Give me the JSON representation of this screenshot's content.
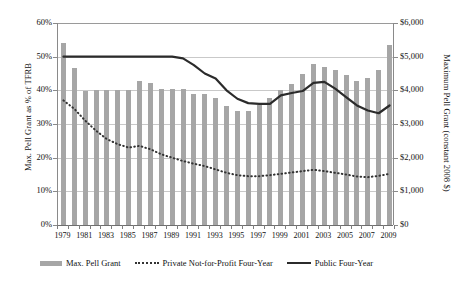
{
  "chart_data": {
    "type": "bar",
    "title": "",
    "subtitle": "",
    "xlabel": "",
    "ylabel": "Max. Pell Grant as % of TFRB",
    "y2label": "Maximum Pell Grant (constant 2008 $)",
    "grid": true,
    "legend_position": "bottom",
    "ylim": [
      0,
      60
    ],
    "y2lim": [
      0,
      6000
    ],
    "yticks": [
      "0%",
      "10%",
      "20%",
      "30%",
      "40%",
      "50%",
      "60%"
    ],
    "ytick_values": [
      0,
      10,
      20,
      30,
      40,
      50,
      60
    ],
    "y2ticks": [
      "$0",
      "$1,000",
      "$2,000",
      "$3,000",
      "$4,000",
      "$5,000",
      "$6,000"
    ],
    "y2tick_values": [
      0,
      1000,
      2000,
      3000,
      4000,
      5000,
      6000
    ],
    "x": [
      1979,
      1980,
      1981,
      1982,
      1983,
      1984,
      1985,
      1986,
      1987,
      1988,
      1989,
      1990,
      1991,
      1992,
      1993,
      1994,
      1995,
      1996,
      1997,
      1998,
      1999,
      2000,
      2001,
      2002,
      2003,
      2004,
      2005,
      2006,
      2007,
      2008,
      2009
    ],
    "xtick_labels": [
      "1979",
      "1981",
      "1983",
      "1985",
      "1987",
      "1989",
      "1991",
      "1993",
      "1995",
      "1997",
      "1999",
      "2001",
      "2003",
      "2005",
      "2007",
      "2009"
    ],
    "xtick_values": [
      1979,
      1981,
      1983,
      1985,
      1987,
      1989,
      1991,
      1993,
      1995,
      1997,
      1999,
      2001,
      2003,
      2005,
      2007,
      2009
    ],
    "series": [
      {
        "name": "Max. Pell Grant",
        "kind": "bar",
        "axis": "right",
        "color": "#a6a6a6",
        "unit": "constant 2008 $",
        "values": [
          5400,
          4650,
          3990,
          4000,
          4000,
          4010,
          4000,
          4280,
          4210,
          4040,
          4030,
          4050,
          3880,
          3880,
          3770,
          3530,
          3380,
          3400,
          3550,
          3770,
          4010,
          4180,
          4480,
          4780,
          4700,
          4600,
          4460,
          4270,
          4380,
          4590,
          5350
        ]
      },
      {
        "name": "Private Not-for-Profit Four-Year",
        "kind": "line",
        "style": "dotted",
        "axis": "left",
        "color": "#333333",
        "unit": "% of TFRB",
        "values": [
          37.0,
          34.5,
          31.0,
          28.0,
          25.5,
          24.0,
          23.0,
          23.5,
          22.5,
          21.0,
          20.0,
          19.0,
          18.2,
          17.5,
          16.5,
          15.5,
          14.8,
          14.5,
          14.5,
          14.8,
          15.2,
          15.6,
          16.0,
          16.4,
          16.0,
          15.5,
          15.0,
          14.4,
          14.2,
          14.6,
          15.2
        ]
      },
      {
        "name": "Public Four-Year",
        "kind": "line",
        "style": "solid",
        "axis": "left",
        "color": "#2b2b2b",
        "unit": "% of TFRB",
        "values": [
          50.0,
          50.0,
          50.0,
          50.0,
          50.0,
          50.0,
          50.0,
          50.0,
          50.0,
          50.0,
          50.0,
          49.5,
          47.5,
          45.0,
          43.5,
          40.0,
          37.5,
          36.2,
          36.0,
          36.0,
          38.5,
          39.2,
          39.8,
          42.2,
          42.5,
          40.5,
          38.0,
          35.5,
          34.0,
          33.2,
          35.5
        ]
      }
    ],
    "legend": [
      {
        "label": "Max. Pell Grant",
        "marker": "bar-swatch"
      },
      {
        "label": "Private Not-for-Profit Four-Year",
        "marker": "dotted-line"
      },
      {
        "label": "Public Four-Year",
        "marker": "solid-line"
      }
    ]
  }
}
